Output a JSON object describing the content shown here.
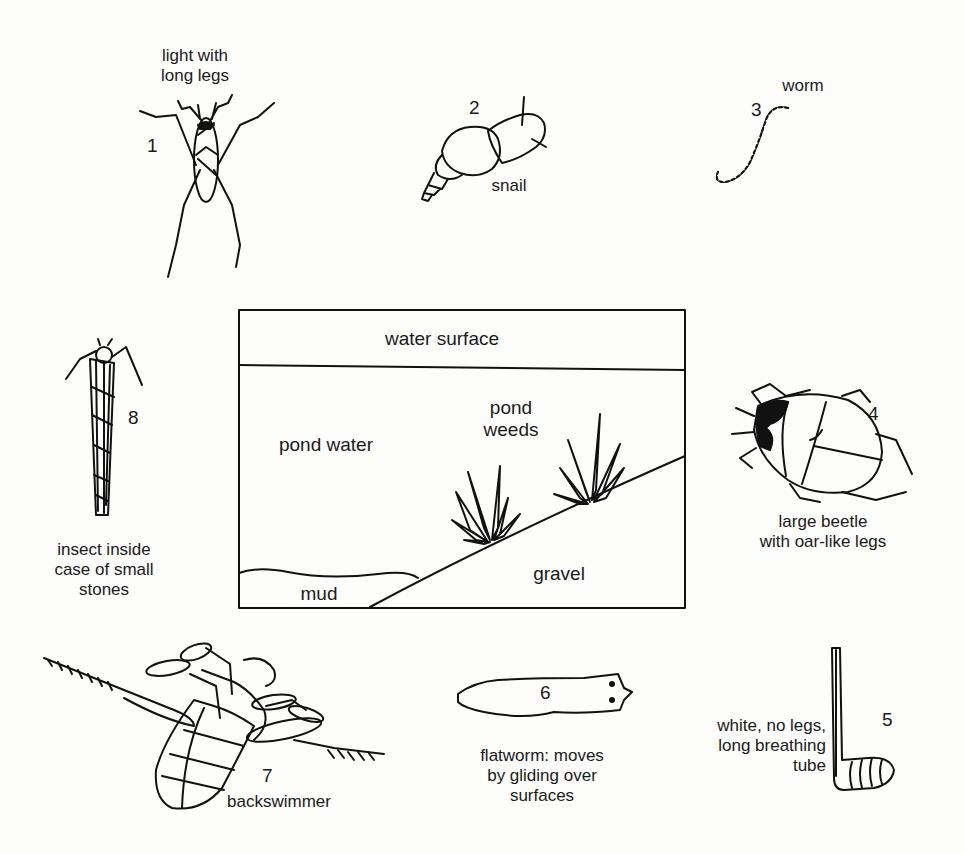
{
  "diagram": {
    "type": "pond habitat with numbered organisms",
    "scene": {
      "labels": {
        "water_surface": "water surface",
        "pond_water": "pond water",
        "pond_weeds": "pond\nweeds",
        "mud": "mud",
        "gravel": "gravel"
      }
    },
    "organisms": [
      {
        "number": "1",
        "label": "light with\nlong legs",
        "icon": "pond-skater-icon"
      },
      {
        "number": "2",
        "label": "snail",
        "icon": "snail-icon"
      },
      {
        "number": "3",
        "label": "worm",
        "icon": "worm-icon"
      },
      {
        "number": "4",
        "label": "large beetle\nwith oar-like legs",
        "icon": "water-beetle-icon"
      },
      {
        "number": "5",
        "label": "white, no legs,\nlong breathing\ntube",
        "icon": "rat-tailed-larva-icon"
      },
      {
        "number": "6",
        "label": "flatworm: moves\nby gliding over\nsurfaces",
        "icon": "flatworm-icon"
      },
      {
        "number": "7",
        "label": "backswimmer",
        "icon": "backswimmer-icon"
      },
      {
        "number": "8",
        "label": "insect inside\ncase of small\nstones",
        "icon": "caddis-larva-icon"
      }
    ]
  }
}
